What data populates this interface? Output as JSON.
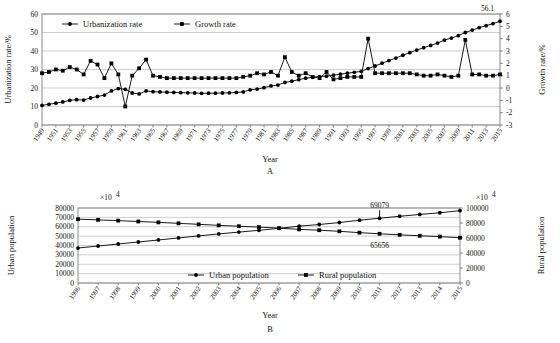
{
  "figure": {
    "panel_a_label": "A",
    "panel_b_label": "B",
    "x_axis_label": "Year",
    "sup_notation": "×10",
    "sup_exponent": "4"
  },
  "chart_data": [
    {
      "type": "line",
      "panel": "A",
      "title": "",
      "xlabel": "Year",
      "ylabel": "Urbanization rate/%",
      "y2label": "Growth rate/%",
      "ylim": [
        0,
        60
      ],
      "y2lim": [
        -3,
        6
      ],
      "yticks": [
        0,
        10,
        20,
        30,
        40,
        50,
        60
      ],
      "y2ticks": [
        -3,
        -2,
        -1,
        0,
        1,
        2,
        3,
        4,
        5,
        6
      ],
      "grid": true,
      "legend_position": "top-left",
      "annotations": [
        {
          "text": "56.1",
          "x": 2015,
          "series": "Urbanization rate"
        }
      ],
      "x": [
        1949,
        1950,
        1951,
        1952,
        1953,
        1954,
        1955,
        1956,
        1957,
        1958,
        1959,
        1960,
        1961,
        1962,
        1963,
        1964,
        1965,
        1966,
        1967,
        1968,
        1969,
        1970,
        1971,
        1972,
        1973,
        1974,
        1975,
        1976,
        1977,
        1978,
        1979,
        1980,
        1981,
        1982,
        1983,
        1984,
        1985,
        1986,
        1987,
        1988,
        1989,
        1990,
        1991,
        1992,
        1993,
        1994,
        1995,
        1996,
        1997,
        1998,
        1999,
        2000,
        2001,
        2002,
        2003,
        2004,
        2005,
        2006,
        2007,
        2008,
        2009,
        2010,
        2011,
        2012,
        2013,
        2014,
        2015
      ],
      "xtick_labels": [
        "1949",
        "1951",
        "1953",
        "1955",
        "1957",
        "1959",
        "1961",
        "1963",
        "1965",
        "1967",
        "1969",
        "1971",
        "1973",
        "1975",
        "1977",
        "1979",
        "1981",
        "1983",
        "1985",
        "1987",
        "1989",
        "1991",
        "1993",
        "1995",
        "1997",
        "1999",
        "2001",
        "2003",
        "2005",
        "2007",
        "2009",
        "2011",
        "2013",
        "2015"
      ],
      "series": [
        {
          "name": "Urbanization rate",
          "axis": "left",
          "marker": "circle",
          "values": [
            10.6,
            11.2,
            11.8,
            12.5,
            13.3,
            13.7,
            13.5,
            14.6,
            15.4,
            16.2,
            18.4,
            19.7,
            19.3,
            17.3,
            16.8,
            18.4,
            18.0,
            17.9,
            17.7,
            17.6,
            17.5,
            17.4,
            17.3,
            17.1,
            17.2,
            17.2,
            17.3,
            17.4,
            17.6,
            17.9,
            19.0,
            19.4,
            20.2,
            21.1,
            21.6,
            23.0,
            23.7,
            24.5,
            25.3,
            25.8,
            26.2,
            26.4,
            26.9,
            27.5,
            28.0,
            28.5,
            29.0,
            30.5,
            31.9,
            33.4,
            34.8,
            36.2,
            37.7,
            39.1,
            40.5,
            41.8,
            43.0,
            44.3,
            45.9,
            47.0,
            48.3,
            50.0,
            51.3,
            52.6,
            53.7,
            54.8,
            56.1
          ]
        },
        {
          "name": "Growth rate",
          "axis": "right",
          "marker": "square",
          "values": [
            1.2,
            1.3,
            1.5,
            1.4,
            1.7,
            1.5,
            1.1,
            2.2,
            1.9,
            0.8,
            2.0,
            1.1,
            -1.5,
            1.0,
            1.6,
            2.3,
            1.0,
            0.9,
            0.8,
            0.8,
            0.8,
            0.8,
            0.8,
            0.8,
            0.8,
            0.8,
            0.8,
            0.8,
            0.8,
            0.9,
            1.0,
            1.2,
            1.1,
            1.3,
            1.0,
            2.5,
            1.3,
            1.0,
            1.2,
            0.9,
            0.8,
            1.3,
            0.7,
            0.8,
            0.9,
            0.9,
            0.9,
            4.0,
            1.2,
            1.2,
            1.2,
            1.2,
            1.2,
            1.2,
            1.1,
            1.0,
            1.0,
            1.1,
            1.0,
            0.9,
            1.0,
            3.9,
            1.1,
            1.1,
            1.0,
            1.0,
            1.1
          ]
        }
      ]
    },
    {
      "type": "line",
      "panel": "B",
      "title": "",
      "xlabel": "Year",
      "ylabel": "Urban population",
      "y2label": "Rural population",
      "ylim": [
        0,
        80000
      ],
      "y2lim": [
        0,
        100000
      ],
      "yticks": [
        0,
        10000,
        20000,
        30000,
        40000,
        50000,
        60000,
        70000,
        80000
      ],
      "y2ticks": [
        0,
        20000,
        40000,
        60000,
        80000,
        100000
      ],
      "grid": true,
      "legend_position": "bottom-center",
      "annotations": [
        {
          "text": "69079",
          "x": 2011,
          "series": "Urban population"
        },
        {
          "text": "65656",
          "x": 2011,
          "series": "Rural population"
        }
      ],
      "x": [
        1996,
        1997,
        1998,
        1999,
        2000,
        2001,
        2002,
        2003,
        2004,
        2005,
        2006,
        2007,
        2008,
        2009,
        2010,
        2011,
        2012,
        2013,
        2014,
        2015
      ],
      "xtick_labels": [
        "1996",
        "1997",
        "1998",
        "1999",
        "2000",
        "2001",
        "2002",
        "2003",
        "2004",
        "2005",
        "2006",
        "2007",
        "2008",
        "2009",
        "2010",
        "2011",
        "2012",
        "2013",
        "2014",
        "2015"
      ],
      "series": [
        {
          "name": "Urban population",
          "axis": "left",
          "marker": "circle",
          "values": [
            37304,
            39449,
            41608,
            43748,
            45906,
            48064,
            50212,
            52376,
            54283,
            56212,
            58288,
            60633,
            62403,
            64512,
            66978,
            69079,
            71182,
            73111,
            74916,
            77116
          ]
        },
        {
          "name": "Rural population",
          "axis": "right",
          "marker": "square",
          "values": [
            85085,
            84177,
            83153,
            82038,
            80837,
            79563,
            78241,
            76851,
            75705,
            74544,
            73160,
            71496,
            70399,
            68938,
            67113,
            65656,
            64222,
            62961,
            61866,
            60346
          ]
        }
      ]
    }
  ]
}
